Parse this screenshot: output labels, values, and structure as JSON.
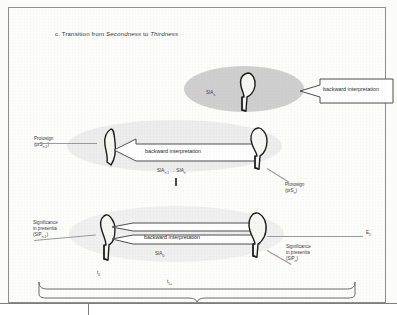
{
  "figure": {
    "caption_prefix": "c.",
    "caption": "c. Transition from Secondness to Thirdness",
    "caption_plain": "Transition from",
    "caption_italic_1": "Secondness",
    "caption_mid": "to",
    "caption_italic_2": "Thirdness"
  },
  "colors": {
    "blob_dark": "#cfcfcf",
    "blob_light": "#ededed",
    "blob_faint": "#f0f0f0",
    "ink": "#2e2e2e",
    "arrow_outline": "#5a5a5a",
    "page_border": "#8e8e8e"
  },
  "rows": {
    "top": {
      "blob_label": "SIA",
      "blob_label_sub": "n",
      "arrow_label": "backward interpretation"
    },
    "middle": {
      "left_label_line1": "Protosign",
      "left_label_line2": "(prS",
      "left_label_line2_sub": "n-1",
      "left_label_line2_end": ")",
      "arrow_label": "backward interpretation",
      "transition_label_a": "SIA",
      "transition_label_a_sub": "n-1",
      "transition_arrow": "→",
      "transition_label_b": "SIA",
      "transition_label_b_sub": "n",
      "right_label_line1": "Protosign",
      "right_label_line2": "(prS",
      "right_label_line2_sub": "n",
      "right_label_line2_end": ")"
    },
    "bottom": {
      "left_label_line1": "Significance",
      "left_label_line2": "in presentia",
      "left_label_line3": "(SiP",
      "left_label_line3_sub": "n-1",
      "left_label_line3_end": ")",
      "arrow_label": "backward interpretation",
      "center_label": "SIA",
      "center_label_sub": "0",
      "time_marker": "t",
      "time_marker_sub": "0",
      "right_label_line1": "Significance",
      "right_label_line2": "in presentia",
      "right_label_line3": "(SiP",
      "right_label_line3_sub": "n",
      "right_label_line3_end": ")",
      "axis_label": "E",
      "axis_label_sub": "1"
    },
    "timeline": {
      "brace_label": "t",
      "brace_label_sub": "1+"
    }
  }
}
